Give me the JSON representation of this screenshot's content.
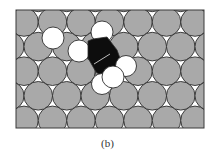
{
  "figure": {
    "caption": "(b)",
    "colors": {
      "surface_atom": "#a9a9a9",
      "outline": "#2e2e2e",
      "hydrogen_atom": "#ffffff",
      "carbon_region": "#0d0d0d",
      "bond_line": "#bdbdbd",
      "background": "#ffffff"
    },
    "frame": {
      "x": 16,
      "y": 10,
      "width": 188,
      "height": 118
    },
    "lattice": {
      "pitch_x": 28.5,
      "pitch_y": 24.6,
      "radius": 14.3,
      "first_row_y": -2.6,
      "rows": 7,
      "x_start_even": 9.75,
      "x_start_odd": 24.0
    },
    "hydrogen_atoms": [
      {
        "cx": 53,
        "cy": 38,
        "r": 11
      },
      {
        "cx": 102,
        "cy": 32,
        "r": 11
      },
      {
        "cx": 79,
        "cy": 51,
        "r": 11
      },
      {
        "cx": 102,
        "cy": 84,
        "r": 10.5
      },
      {
        "cx": 126,
        "cy": 66,
        "r": 10.5
      },
      {
        "cx": 113,
        "cy": 77,
        "r": 11
      }
    ],
    "carbon_polygon": "88,41 93,39 107,37 117,50 121,61 112,70 100,75 96,72 88,58",
    "bond_line": {
      "x1": 94,
      "y1": 64,
      "x2": 110,
      "y2": 54
    }
  }
}
